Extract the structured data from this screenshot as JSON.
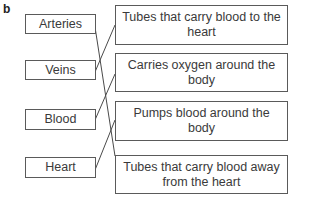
{
  "exercise_label": "b",
  "left_terms": [
    {
      "label": "Arteries"
    },
    {
      "label": "Veins"
    },
    {
      "label": "Blood"
    },
    {
      "label": "Heart"
    }
  ],
  "right_definitions": [
    {
      "label": "Tubes that carry blood to the heart"
    },
    {
      "label": "Carries oxygen around the body"
    },
    {
      "label": "Pumps blood around the body"
    },
    {
      "label": "Tubes that carry blood away from the heart"
    }
  ],
  "matches": [
    {
      "term": "Arteries",
      "definition": "Tubes that carry blood away from the heart"
    },
    {
      "term": "Veins",
      "definition": "Tubes that carry blood to the heart"
    },
    {
      "term": "Blood",
      "definition": "Carries oxygen around the body"
    },
    {
      "term": "Heart",
      "definition": "Pumps blood around the body"
    }
  ]
}
